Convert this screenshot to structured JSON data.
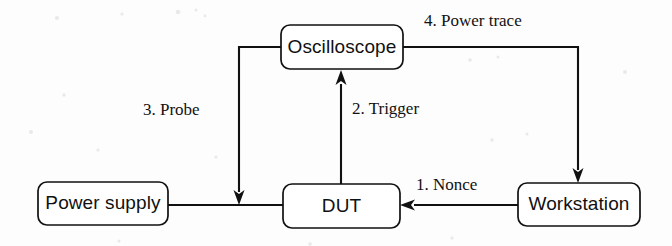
{
  "diagram": {
    "background_color": "#fdfdfd",
    "line_color": "#111111",
    "box_fill_color": "#ffffff",
    "nodes": [
      {
        "id": "oscilloscope",
        "label": "Oscilloscope",
        "x": 281,
        "y": 25,
        "w": 122,
        "h": 44
      },
      {
        "id": "power-supply",
        "label": "Power supply",
        "x": 38,
        "y": 182,
        "w": 130,
        "h": 43
      },
      {
        "id": "dut",
        "label": "DUT",
        "x": 283,
        "y": 184,
        "w": 117,
        "h": 44
      },
      {
        "id": "workstation",
        "label": "Workstation",
        "x": 518,
        "y": 183,
        "w": 122,
        "h": 43
      }
    ],
    "edges": [
      {
        "id": "nonce",
        "label": "1. Nonce",
        "from": "workstation",
        "to": "dut",
        "label_x": 416,
        "label_y": 186
      },
      {
        "id": "trigger",
        "label": "2. Trigger",
        "from": "dut",
        "to": "oscilloscope",
        "label_x": 352,
        "label_y": 110
      },
      {
        "id": "probe",
        "label": "3. Probe",
        "from": "oscilloscope",
        "to": "power-supply-to-dut-line",
        "label_x": 143,
        "label_y": 111
      },
      {
        "id": "power-trace",
        "label": "4. Power trace",
        "from": "oscilloscope",
        "to": "workstation",
        "label_x": 424,
        "label_y": 22
      }
    ]
  }
}
